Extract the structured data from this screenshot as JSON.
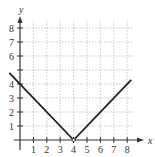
{
  "chart_data": {
    "type": "line",
    "title": "",
    "xlabel": "x",
    "ylabel": "y",
    "x_ticks": [
      "1",
      "2",
      "3",
      "4",
      "5",
      "6",
      "7",
      "8"
    ],
    "y_ticks": [
      "1",
      "2",
      "3",
      "4",
      "6",
      "7",
      "8"
    ],
    "xlim": [
      0,
      8.4
    ],
    "ylim": [
      0,
      8.6
    ],
    "grid": true,
    "series": [
      {
        "name": "y = |x - 4|",
        "x": [
          -0.8,
          4,
          8.3
        ],
        "y": [
          4.8,
          0,
          4.3
        ],
        "color": "#222222"
      }
    ],
    "annotations": [
      "open point at (4, 0)"
    ]
  }
}
